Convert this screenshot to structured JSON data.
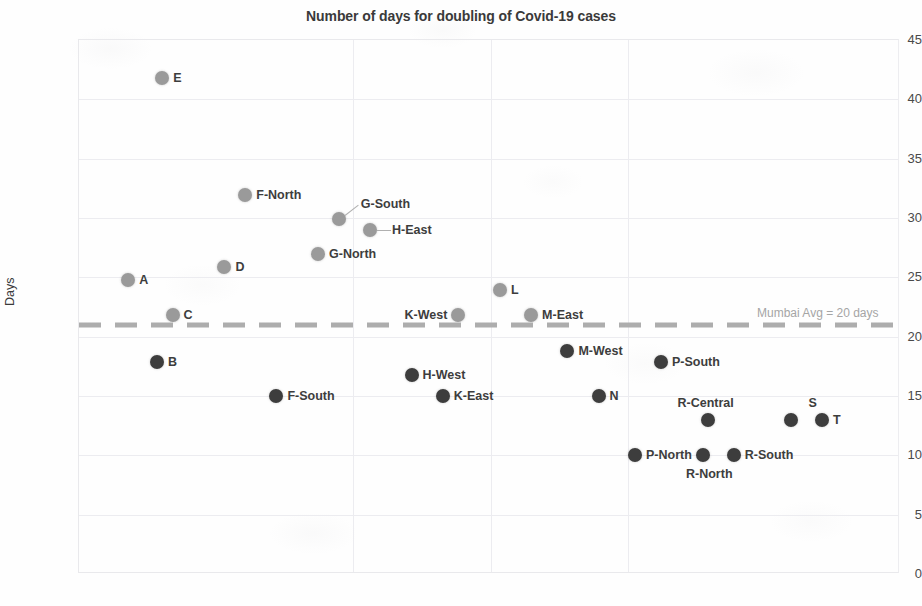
{
  "chart_data": {
    "type": "scatter",
    "title": "Number of days for doubling of Covid-19 cases",
    "xlabel": "",
    "ylabel": "Days",
    "ylim": [
      0,
      45
    ],
    "ytick_step": 5,
    "yticks": [
      "45",
      "40",
      "35",
      "30",
      "25",
      "20",
      "15",
      "10",
      "5",
      "0"
    ],
    "grid": true,
    "legend": "none",
    "xaxis_labels_shown": false,
    "series": [
      {
        "name": "Above Mumbai average",
        "color": "#9a9a9a",
        "points": [
          {
            "label": "E",
            "x": 1.0,
            "value": 41.8,
            "label_pos": "right"
          },
          {
            "label": "F-North",
            "x": 2.6,
            "value": 31.9,
            "label_pos": "right"
          },
          {
            "label": "G-South",
            "x": 4.4,
            "value": 29.9,
            "label_pos": "leader-up-right"
          },
          {
            "label": "H-East",
            "x": 5.0,
            "value": 29.0,
            "label_pos": "leader-right"
          },
          {
            "label": "G-North",
            "x": 4.0,
            "value": 27.0,
            "label_pos": "right"
          },
          {
            "label": "D",
            "x": 2.2,
            "value": 25.9,
            "label_pos": "right"
          },
          {
            "label": "A",
            "x": 0.35,
            "value": 24.8,
            "label_pos": "right"
          },
          {
            "label": "L",
            "x": 7.5,
            "value": 23.9,
            "label_pos": "right"
          },
          {
            "label": "C",
            "x": 1.2,
            "value": 21.8,
            "label_pos": "right"
          },
          {
            "label": "K-West",
            "x": 6.7,
            "value": 21.8,
            "label_pos": "left"
          },
          {
            "label": "M-East",
            "x": 8.1,
            "value": 21.8,
            "label_pos": "right"
          }
        ]
      },
      {
        "name": "Below Mumbai average",
        "color": "#3d3d3d",
        "points": [
          {
            "label": "M-West",
            "x": 8.8,
            "value": 18.8,
            "label_pos": "right"
          },
          {
            "label": "B",
            "x": 0.9,
            "value": 17.9,
            "label_pos": "right"
          },
          {
            "label": "P-South",
            "x": 10.6,
            "value": 17.9,
            "label_pos": "right"
          },
          {
            "label": "H-West",
            "x": 5.8,
            "value": 16.8,
            "label_pos": "right"
          },
          {
            "label": "F-South",
            "x": 3.2,
            "value": 15.0,
            "label_pos": "right"
          },
          {
            "label": "K-East",
            "x": 6.4,
            "value": 15.0,
            "label_pos": "right"
          },
          {
            "label": "N",
            "x": 9.4,
            "value": 15.0,
            "label_pos": "right"
          },
          {
            "label": "R-Central",
            "x": 11.5,
            "value": 13.0,
            "label_pos": "above"
          },
          {
            "label": "S",
            "x": 13.1,
            "value": 13.0,
            "label_pos": "above"
          },
          {
            "label": "T",
            "x": 13.7,
            "value": 13.0,
            "label_pos": "right"
          },
          {
            "label": "P-North",
            "x": 10.1,
            "value": 10.0,
            "label_pos": "right"
          },
          {
            "label": "R-North",
            "x": 11.4,
            "value": 10.0,
            "label_pos": "below"
          },
          {
            "label": "R-South",
            "x": 12.0,
            "value": 10.0,
            "label_pos": "right"
          }
        ]
      }
    ],
    "reference_line": {
      "label": "Mumbai Avg = 20 days",
      "value": 21,
      "style": "dashed",
      "color": "#adadad"
    }
  }
}
